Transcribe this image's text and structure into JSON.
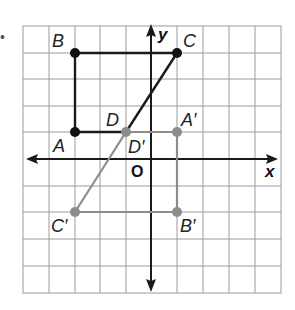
{
  "diagram": {
    "title": "",
    "marker_bullet": "•",
    "grid": {
      "columns": 10,
      "rows": 10,
      "x_min": -5,
      "x_max": 5,
      "y_min": -5,
      "y_max": 5,
      "line_color": "#9a9a9a"
    },
    "axes": {
      "x_label": "x",
      "y_label": "y",
      "origin_label": "O",
      "color": "#1a1a1a"
    },
    "original_figure": {
      "color": "#1a1a1a",
      "points": [
        {
          "name": "A",
          "label": "A",
          "x": -3,
          "y": 1
        },
        {
          "name": "B",
          "label": "B",
          "x": -3,
          "y": 4
        },
        {
          "name": "C",
          "label": "C",
          "x": 1,
          "y": 4
        },
        {
          "name": "D",
          "label": "D",
          "x": -1,
          "y": 1
        }
      ]
    },
    "image_figure": {
      "color": "#8c8c8c",
      "points": [
        {
          "name": "A'",
          "label": "A′",
          "x": 1,
          "y": 1
        },
        {
          "name": "B'",
          "label": "B′",
          "x": 1,
          "y": -2
        },
        {
          "name": "C'",
          "label": "C′",
          "x": -3,
          "y": -2
        },
        {
          "name": "D'",
          "label": "D′",
          "x": -1,
          "y": 1
        }
      ]
    }
  }
}
